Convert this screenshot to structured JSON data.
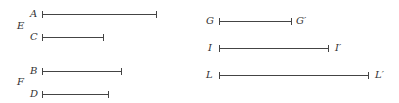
{
  "left": {
    "groups": [
      {
        "label": "E",
        "segments": [
          {
            "label": "A",
            "length_px": 115
          },
          {
            "label": "C",
            "length_px": 62
          }
        ]
      },
      {
        "label": "F",
        "segments": [
          {
            "label": "B",
            "length_px": 80
          },
          {
            "label": "D",
            "length_px": 67
          }
        ]
      }
    ]
  },
  "right": {
    "segments": [
      {
        "start": "G",
        "end": "G′",
        "length_px": 73
      },
      {
        "start": "I",
        "end": "I′",
        "length_px": 110
      },
      {
        "start": "L",
        "end": "L′",
        "length_px": 150
      }
    ]
  }
}
